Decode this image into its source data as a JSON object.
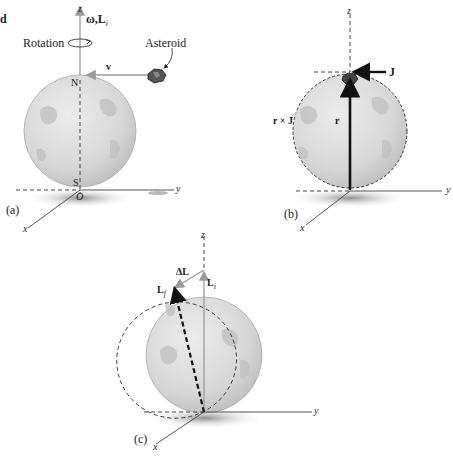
{
  "figure": {
    "panels": [
      {
        "id": "a",
        "caption": "(a)",
        "labels": {
          "z_axis": "z",
          "y_axis": "y",
          "x_axis": "x",
          "omega_L": "ω,L",
          "omega_L_sub": "i",
          "rotation": "Rotation",
          "asteroid": "Asteroid",
          "velocity": "v",
          "north": "N",
          "south": "S",
          "origin": "O"
        }
      },
      {
        "id": "b",
        "caption": "(b)",
        "labels": {
          "z_axis": "z",
          "y_axis": "y",
          "x_axis": "x",
          "impulse": "J",
          "position": "r",
          "torque_impulse": "r × J"
        }
      },
      {
        "id": "c",
        "caption": "(c)",
        "labels": {
          "z_axis": "z",
          "y_axis": "y",
          "x_axis": "x",
          "delta_L": "ΔL",
          "L_initial": "L",
          "L_initial_sub": "i",
          "L_final": "L",
          "L_final_sub": "f"
        }
      }
    ],
    "colors": {
      "globe_fill": "#d4d4d4",
      "globe_edge": "#9a9a9a",
      "vector_gray": "#a0a0a0",
      "vector_black": "#111111",
      "axis": "#444444",
      "shadow": "#8a8a8a"
    },
    "partial_text_top_left": "d"
  }
}
